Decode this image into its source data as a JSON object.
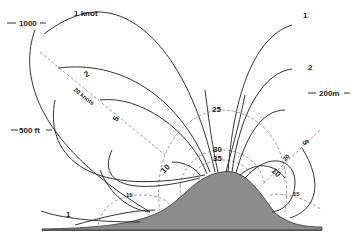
{
  "diagram": {
    "type": "wind-flow-over-hill",
    "colors": {
      "hill_fill": "#8c8c8c",
      "line": "#333333",
      "dashed": "#888888",
      "background": "#ffffff"
    },
    "scale_labels": {
      "height_1000": "1000",
      "height_500": "500 ft",
      "distance_200m": "200m"
    },
    "solid_contour_labels": {
      "left_1knot": "1 knot",
      "left_2": "2",
      "left_5": "5",
      "left_10": "10",
      "left_1_low": "1",
      "right_1": "1",
      "right_2": "2",
      "right_5": "5",
      "right_10": "10"
    },
    "dashed_contour_labels": {
      "top_25": "25",
      "top_30": "30",
      "top_35": "35",
      "left_15": "15",
      "right_15": "15",
      "diag_left_20": "20 knots",
      "diag_right_20": "20"
    }
  }
}
